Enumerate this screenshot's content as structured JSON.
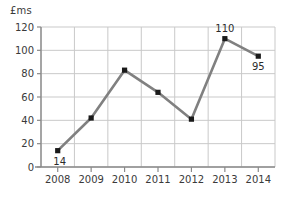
{
  "chart_data": {
    "type": "line",
    "title": "",
    "subtitle": "",
    "xlabel": "",
    "ylabel": "£ms",
    "categories": [
      "2008",
      "2009",
      "2010",
      "2011",
      "2012",
      "2013",
      "2014"
    ],
    "values": [
      14,
      42,
      83,
      64,
      41,
      110,
      95
    ],
    "series": [
      {
        "name": "",
        "values": [
          14,
          42,
          83,
          64,
          41,
          110,
          95
        ]
      }
    ],
    "point_labels": [
      {
        "category": "2008",
        "value": 14,
        "text": "14",
        "position": "below-left"
      },
      {
        "category": "2009",
        "value": 42,
        "text": "",
        "position": "none"
      },
      {
        "category": "2010",
        "value": 83,
        "text": "",
        "position": "none"
      },
      {
        "category": "2011",
        "value": 64,
        "text": "",
        "position": "none"
      },
      {
        "category": "2012",
        "value": 41,
        "text": "",
        "position": "none"
      },
      {
        "category": "2013",
        "value": 110,
        "text": "110",
        "position": "above"
      },
      {
        "category": "2014",
        "value": 95,
        "text": "95",
        "position": "below"
      }
    ],
    "ylim": [
      0,
      120
    ],
    "yticks": [
      "0",
      "20",
      "40",
      "60",
      "80",
      "100",
      "120"
    ],
    "ytick_values": [
      0,
      20,
      40,
      60,
      80,
      100,
      120
    ],
    "xticks": [
      "2008",
      "2009",
      "2010",
      "2011",
      "2012",
      "2013",
      "2014"
    ],
    "grid": true,
    "grid_axis": "both",
    "legend": false,
    "legend_position": "none",
    "colors": {
      "line": "#808080",
      "marker": "#1a1a1a",
      "grid": "#c9c9c9",
      "axis": "#8a8a8a",
      "text": "#3a3a3a",
      "background": "#ffffff"
    }
  }
}
